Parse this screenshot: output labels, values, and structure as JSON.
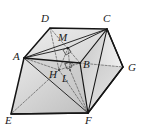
{
  "figure": {
    "kind": "geometric-solid-diagram",
    "canvas": {
      "width": 141,
      "height": 130
    },
    "colors": {
      "stroke": "#1a1a1a",
      "dashed": "#555555",
      "fill_light": "#e2e2e2",
      "fill_mid": "#cfcfcf",
      "fill_dark": "#bdbdbd",
      "fill_darker": "#ababab",
      "background": "#ffffff",
      "label": "#1a1a1a"
    },
    "vertices": [
      {
        "id": "A",
        "label": "A",
        "x": 24,
        "y": 58,
        "label_x": 13,
        "label_y": 51
      },
      {
        "id": "B",
        "label": "B",
        "x": 80,
        "y": 63,
        "label_x": 83,
        "label_y": 59
      },
      {
        "id": "C",
        "label": "C",
        "x": 107,
        "y": 29,
        "label_x": 103,
        "label_y": 13
      },
      {
        "id": "D",
        "label": "D",
        "x": 50,
        "y": 28,
        "label_x": 41,
        "label_y": 13
      },
      {
        "id": "E",
        "label": "E",
        "x": 11,
        "y": 114,
        "label_x": 5,
        "label_y": 115
      },
      {
        "id": "F",
        "label": "F",
        "x": 88,
        "y": 113,
        "label_x": 85,
        "label_y": 115
      },
      {
        "id": "G",
        "label": "G",
        "x": 123,
        "y": 67,
        "label_x": 128,
        "label_y": 62
      },
      {
        "id": "H",
        "label": "H",
        "x": 59,
        "y": 70,
        "label_x": 49,
        "label_y": 69
      },
      {
        "id": "L",
        "label": "L",
        "x": 70,
        "y": 70,
        "label_x": 62,
        "label_y": 73
      },
      {
        "id": "M",
        "label": "M",
        "x": 68,
        "y": 48,
        "label_x": 58,
        "label_y": 32
      }
    ],
    "edges_solid": [
      "A-D",
      "D-C",
      "C-G",
      "G-F",
      "F-E",
      "E-A",
      "A-B",
      "B-C",
      "B-F",
      "C-F",
      "A-F",
      "A-C",
      "A-M",
      "M-C",
      "D-M",
      "B-G"
    ],
    "edges_dashed": [
      "D-H",
      "H-B",
      "H-E",
      "H-F",
      "M-H",
      "M-L",
      "L-F",
      "B-L",
      "D-B"
    ],
    "right_angle_marks": [
      {
        "at": "M",
        "x": 64,
        "y": 50
      },
      {
        "at": "L",
        "x": 68,
        "y": 66
      }
    ]
  }
}
